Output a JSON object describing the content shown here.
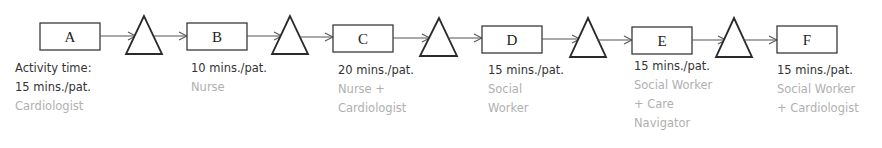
{
  "diagram": {
    "type": "process-flow",
    "activities": [
      {
        "id": "A",
        "time_prefix": "Activity time:",
        "time": "15 mins./pat.",
        "role": [
          "Cardiologist"
        ]
      },
      {
        "id": "B",
        "time": "10 mins./pat.",
        "role": [
          "Nurse"
        ]
      },
      {
        "id": "C",
        "time": "20 mins./pat.",
        "role": [
          "Nurse +",
          "Cardiologist"
        ]
      },
      {
        "id": "D",
        "time": "15 mins./pat.",
        "role": [
          "Social",
          "Worker"
        ]
      },
      {
        "id": "E",
        "time": "15 mins./pat.",
        "role": [
          "Social Worker",
          "+ Care",
          "Navigator"
        ]
      },
      {
        "id": "F",
        "time": "15 mins./pat.",
        "role": [
          "Social Worker",
          "+ Cardiologist"
        ]
      }
    ],
    "buffers": [
      {
        "symbol": "triangle",
        "between": "A-B"
      },
      {
        "symbol": "triangle",
        "between": "B-C"
      },
      {
        "symbol": "triangle",
        "between": "C-D"
      },
      {
        "symbol": "triangle",
        "between": "D-E"
      },
      {
        "symbol": "triangle",
        "between": "E-F"
      }
    ],
    "colors": {
      "time_text": "#333333",
      "role_text": "#b0b0b0",
      "stroke": "#2a2a2a"
    }
  }
}
